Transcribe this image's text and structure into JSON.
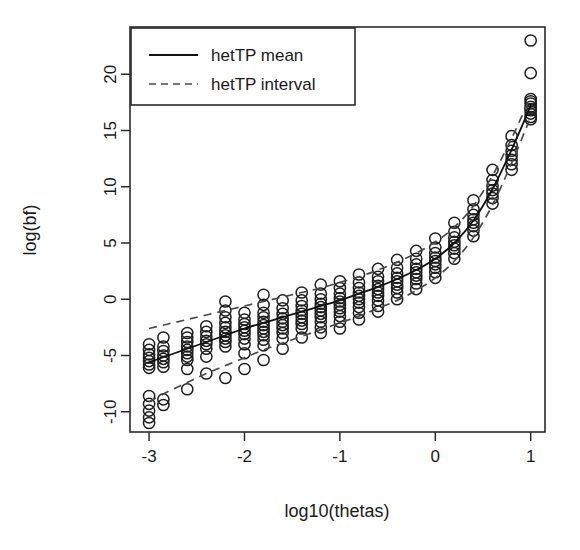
{
  "chart_data": {
    "type": "scatter",
    "title": "",
    "subtitle": "",
    "xlabel": "log10(thetas)",
    "ylabel": "log(bf)",
    "xlim": [
      -3.2,
      1.15
    ],
    "ylim": [
      -11.8,
      24.2
    ],
    "xticks": [
      -3,
      -2,
      -1,
      0,
      1
    ],
    "xtick_labels": [
      "-3",
      "-2",
      "-1",
      "0",
      "1"
    ],
    "yticks": [
      -10,
      -5,
      0,
      5,
      10,
      15,
      20
    ],
    "ytick_labels": [
      "-10",
      "-5",
      "0",
      "5",
      "10",
      "15",
      "20"
    ],
    "grid": false,
    "box": true,
    "marker": "open-circle",
    "legend_position": "top-left",
    "legend": [
      {
        "label": "hetTP mean",
        "style": "solid",
        "color": "#111111"
      },
      {
        "label": "hetTP interval",
        "style": "dashed",
        "color": "#4a4a4a"
      }
    ],
    "series": [
      {
        "name": "hetTP mean",
        "style": "solid",
        "x": [
          -3.0,
          -2.8,
          -2.6,
          -2.4,
          -2.2,
          -2.0,
          -1.8,
          -1.6,
          -1.4,
          -1.2,
          -1.0,
          -0.8,
          -0.6,
          -0.4,
          -0.2,
          0.0,
          0.2,
          0.4,
          0.6,
          0.8,
          1.0
        ],
        "y": [
          -5.6,
          -5.0,
          -4.4,
          -3.8,
          -3.2,
          -2.6,
          -2.1,
          -1.6,
          -1.1,
          -0.6,
          -0.1,
          0.5,
          1.1,
          1.8,
          2.6,
          3.6,
          5.0,
          7.0,
          9.8,
          13.3,
          17.2
        ]
      },
      {
        "name": "hetTP interval upper",
        "style": "dashed",
        "x": [
          -3.0,
          -2.8,
          -2.6,
          -2.4,
          -2.2,
          -2.0,
          -1.8,
          -1.6,
          -1.4,
          -1.2,
          -1.0,
          -0.8,
          -0.6,
          -0.4,
          -0.2,
          0.0,
          0.2,
          0.4,
          0.6,
          0.8,
          1.0
        ],
        "y": [
          -2.6,
          -2.2,
          -1.8,
          -1.4,
          -1.0,
          -0.6,
          -0.2,
          0.2,
          0.6,
          1.0,
          1.5,
          2.0,
          2.6,
          3.3,
          4.1,
          5.1,
          6.4,
          8.3,
          11.0,
          14.3,
          18.0
        ]
      },
      {
        "name": "hetTP interval lower",
        "style": "dashed",
        "x": [
          -3.0,
          -2.8,
          -2.6,
          -2.4,
          -2.2,
          -2.0,
          -1.8,
          -1.6,
          -1.4,
          -1.2,
          -1.0,
          -0.8,
          -0.6,
          -0.4,
          -0.2,
          0.0,
          0.2,
          0.4,
          0.6,
          0.8,
          1.0
        ],
        "y": [
          -9.1,
          -8.2,
          -7.4,
          -6.6,
          -5.9,
          -5.2,
          -4.5,
          -3.9,
          -3.3,
          -2.7,
          -2.1,
          -1.5,
          -0.8,
          -0.1,
          0.8,
          1.9,
          3.4,
          5.5,
          8.4,
          12.1,
          16.2
        ]
      }
    ],
    "points": {
      "x": [
        -3.0,
        -3.0,
        -3.0,
        -3.0,
        -3.0,
        -3.0,
        -3.0,
        -3.0,
        -3.0,
        -3.0,
        -3.0,
        -3.0,
        -2.85,
        -2.85,
        -2.85,
        -2.85,
        -2.85,
        -2.85,
        -2.85,
        -2.85,
        -2.85,
        -2.6,
        -2.6,
        -2.6,
        -2.6,
        -2.6,
        -2.6,
        -2.6,
        -2.6,
        -2.6,
        -2.6,
        -2.4,
        -2.4,
        -2.4,
        -2.4,
        -2.4,
        -2.4,
        -2.4,
        -2.4,
        -2.2,
        -2.2,
        -2.2,
        -2.2,
        -2.2,
        -2.2,
        -2.2,
        -2.2,
        -2.2,
        -2.2,
        -2.2,
        -2.0,
        -2.0,
        -2.0,
        -2.0,
        -2.0,
        -2.0,
        -2.0,
        -2.0,
        -2.0,
        -2.0,
        -1.8,
        -1.8,
        -1.8,
        -1.8,
        -1.8,
        -1.8,
        -1.8,
        -1.8,
        -1.8,
        -1.8,
        -1.8,
        -1.8,
        -1.6,
        -1.6,
        -1.6,
        -1.6,
        -1.6,
        -1.6,
        -1.6,
        -1.6,
        -1.6,
        -1.6,
        -1.4,
        -1.4,
        -1.4,
        -1.4,
        -1.4,
        -1.4,
        -1.4,
        -1.4,
        -1.4,
        -1.4,
        -1.2,
        -1.2,
        -1.2,
        -1.2,
        -1.2,
        -1.2,
        -1.2,
        -1.2,
        -1.2,
        -1.2,
        -1.2,
        -1.0,
        -1.0,
        -1.0,
        -1.0,
        -1.0,
        -1.0,
        -1.0,
        -1.0,
        -1.0,
        -1.0,
        -1.0,
        -0.8,
        -0.8,
        -0.8,
        -0.8,
        -0.8,
        -0.8,
        -0.8,
        -0.8,
        -0.8,
        -0.8,
        -0.6,
        -0.6,
        -0.6,
        -0.6,
        -0.6,
        -0.6,
        -0.6,
        -0.6,
        -0.6,
        -0.6,
        -0.4,
        -0.4,
        -0.4,
        -0.4,
        -0.4,
        -0.4,
        -0.4,
        -0.4,
        -0.4,
        -0.2,
        -0.2,
        -0.2,
        -0.2,
        -0.2,
        -0.2,
        -0.2,
        -0.2,
        -0.2,
        0.0,
        0.0,
        0.0,
        0.0,
        0.0,
        0.0,
        0.0,
        0.0,
        0.0,
        0.2,
        0.2,
        0.2,
        0.2,
        0.2,
        0.2,
        0.2,
        0.2,
        0.4,
        0.4,
        0.4,
        0.4,
        0.4,
        0.4,
        0.4,
        0.4,
        0.6,
        0.6,
        0.6,
        0.6,
        0.6,
        0.6,
        0.6,
        0.8,
        0.8,
        0.8,
        0.8,
        0.8,
        0.8,
        0.8,
        1.0,
        1.0,
        1.0,
        1.0,
        1.0,
        1.0,
        1.0,
        1.0,
        1.0,
        1.0,
        1.0
      ],
      "y": [
        -4.0,
        -4.5,
        -4.9,
        -5.2,
        -5.5,
        -5.8,
        -6.1,
        -8.6,
        -9.3,
        -9.9,
        -10.5,
        -11.0,
        -3.4,
        -4.2,
        -4.6,
        -5.0,
        -5.3,
        -5.6,
        -6.0,
        -8.9,
        -9.4,
        -3.0,
        -3.4,
        -3.8,
        -4.2,
        -4.5,
        -4.8,
        -5.1,
        -5.4,
        -6.2,
        -8.0,
        -2.4,
        -2.9,
        -3.3,
        -3.7,
        -4.0,
        -4.4,
        -5.1,
        -6.6,
        -0.2,
        -1.0,
        -1.6,
        -2.1,
        -2.5,
        -2.9,
        -3.2,
        -3.5,
        -3.8,
        -4.2,
        -7.0,
        -1.2,
        -1.8,
        -2.2,
        -2.5,
        -2.8,
        -3.1,
        -3.5,
        -4.0,
        -4.8,
        -6.2,
        0.4,
        -0.5,
        -1.2,
        -1.6,
        -2.0,
        -2.3,
        -2.6,
        -2.9,
        -3.2,
        -3.6,
        -4.1,
        -5.4,
        -0.1,
        -0.8,
        -1.3,
        -1.7,
        -2.0,
        -2.3,
        -2.6,
        -3.0,
        -3.5,
        -4.4,
        0.6,
        -0.1,
        -0.6,
        -1.0,
        -1.3,
        -1.6,
        -1.9,
        -2.2,
        -2.6,
        -3.4,
        1.3,
        0.5,
        0.0,
        -0.4,
        -0.7,
        -1.0,
        -1.3,
        -1.6,
        -2.0,
        -2.5,
        -3.0,
        1.6,
        1.0,
        0.5,
        0.1,
        -0.2,
        -0.5,
        -0.8,
        -1.1,
        -1.5,
        -2.0,
        -2.6,
        2.2,
        1.5,
        1.0,
        0.6,
        0.3,
        0.0,
        -0.3,
        -0.7,
        -1.2,
        -1.8,
        2.7,
        2.0,
        1.6,
        1.2,
        0.9,
        0.6,
        0.3,
        -0.1,
        -0.6,
        -1.1,
        3.5,
        2.8,
        2.3,
        1.9,
        1.6,
        1.3,
        1.0,
        0.6,
        0.0,
        4.3,
        3.6,
        3.1,
        2.7,
        2.4,
        2.1,
        1.8,
        1.4,
        0.9,
        5.4,
        4.6,
        4.1,
        3.7,
        3.4,
        3.1,
        2.8,
        2.4,
        1.9,
        6.8,
        6.0,
        5.5,
        5.1,
        4.8,
        4.5,
        4.1,
        3.6,
        8.8,
        8.0,
        7.5,
        7.1,
        6.8,
        6.5,
        6.1,
        5.6,
        11.5,
        10.6,
        10.1,
        9.7,
        9.4,
        9.0,
        8.5,
        14.5,
        13.7,
        13.2,
        12.8,
        12.4,
        12.0,
        11.5,
        23.0,
        20.1,
        17.8,
        17.4,
        17.1,
        16.8,
        16.5,
        16.2,
        16.0,
        17.6,
        16.9
      ]
    }
  }
}
